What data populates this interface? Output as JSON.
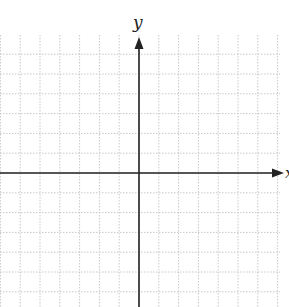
{
  "diagram": {
    "type": "cartesian-coordinate-plane",
    "x_axis_label": "x",
    "y_axis_label": "y",
    "grid": {
      "style": "dotted",
      "color": "#c8c8c8",
      "spacing_px": 19.8,
      "origin_px": [
        139,
        173
      ],
      "extent_px": {
        "left": 0,
        "right": 280,
        "top": 35,
        "bottom": 307
      }
    },
    "axis_color": "#222222"
  }
}
